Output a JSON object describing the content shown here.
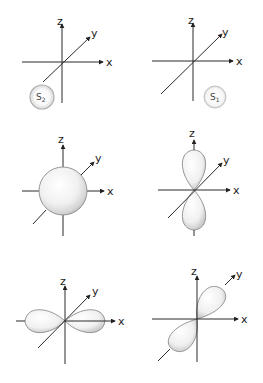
{
  "diagram": {
    "panels": [
      {
        "id": "s2-particle",
        "axis_labels": {
          "x": "x",
          "y": "y",
          "z": "z"
        },
        "sphere_label": {
          "main": "S",
          "sub": "2"
        }
      },
      {
        "id": "s1-particle",
        "axis_labels": {
          "x": "x",
          "y": "y",
          "z": "z"
        },
        "sphere_label": {
          "main": "S",
          "sub": "1"
        }
      },
      {
        "id": "s-orbital",
        "axis_labels": {
          "x": "x",
          "y": "y",
          "z": "z"
        }
      },
      {
        "id": "pz-orbital",
        "axis_labels": {
          "x": "x",
          "y": "y",
          "z": "z"
        }
      },
      {
        "id": "px-orbital",
        "axis_labels": {
          "x": "x",
          "y": "y",
          "z": "z"
        }
      },
      {
        "id": "py-orbital",
        "axis_labels": {
          "x": "x",
          "y": "y",
          "z": "z"
        }
      }
    ],
    "colors": {
      "axis": "#2a2a2a",
      "shell_fill": "#f4f4f4",
      "shell_shade": "#c8c8c8",
      "shell_stroke": "#9a9a9a"
    }
  }
}
